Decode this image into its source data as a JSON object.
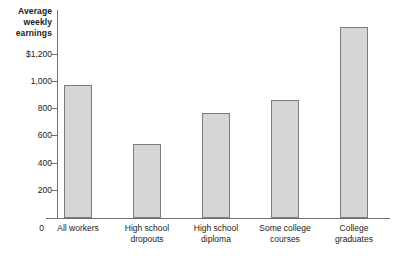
{
  "chart_data": {
    "type": "bar",
    "title": "Average weekly earnings",
    "title_lines": [
      "Average",
      "weekly",
      "earnings"
    ],
    "xlabel": "",
    "ylabel": "Average weekly earnings",
    "categories": [
      "All workers",
      "High school dropouts",
      "High school diploma",
      "Some college courses",
      "College graduates"
    ],
    "category_lines": [
      [
        "All workers",
        ""
      ],
      [
        "High school",
        "dropouts"
      ],
      [
        "High school",
        "diploma"
      ],
      [
        "Some college",
        "courses"
      ],
      [
        "College",
        "graduates"
      ]
    ],
    "values": [
      830,
      465,
      655,
      740,
      1195
    ],
    "ylim": [
      0,
      1300
    ],
    "yticks": [
      0,
      200,
      400,
      600,
      800,
      1000,
      1200
    ],
    "ytick_labels": [
      "0",
      "200",
      "400",
      "600",
      "800",
      "1,000",
      "$1,200"
    ],
    "grid": false,
    "legend": false,
    "bar_fill": "#d6d6d6",
    "bar_border": "#7d7d7d",
    "axis_color": "#6f6f6f",
    "background": "#ffffff"
  }
}
